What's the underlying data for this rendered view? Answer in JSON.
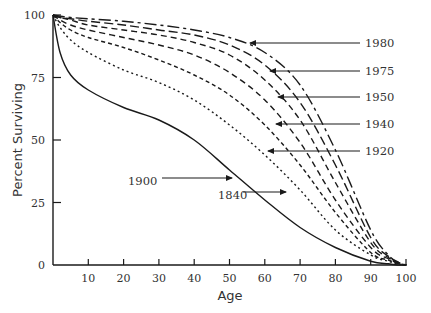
{
  "chart_data": {
    "type": "line",
    "title": "",
    "xlabel": "Age",
    "ylabel": "Percent Surviving",
    "xlim": [
      0,
      100
    ],
    "ylim": [
      0,
      100
    ],
    "grid": false,
    "x_ticks": [
      10,
      20,
      30,
      40,
      50,
      60,
      70,
      80,
      90,
      100
    ],
    "x_tick_labels": [
      "10",
      "20",
      "30",
      "40",
      "50",
      "60",
      "70",
      "80",
      "90",
      "100"
    ],
    "y_ticks": [
      0,
      25,
      50,
      75,
      100
    ],
    "y_tick_labels": [
      "0",
      "25",
      "50",
      "75",
      "100"
    ],
    "legend_position": "inline arrows",
    "x": [
      0,
      2,
      5,
      10,
      20,
      30,
      40,
      50,
      60,
      70,
      80,
      90,
      95,
      98,
      100
    ],
    "series": [
      {
        "name": "1840",
        "style": "solid",
        "values": [
          100,
          85,
          76,
          70,
          63,
          58,
          50,
          38,
          26,
          15,
          7,
          1.5,
          0.5,
          0,
          0
        ],
        "label_pos": {
          "x": 218,
          "y": 195
        },
        "arrow": {
          "x1": 243,
          "x2": 286,
          "y": 192
        }
      },
      {
        "name": "1900",
        "style": "dotted",
        "values": [
          100,
          95,
          90,
          85,
          78,
          73,
          66,
          56,
          44,
          30,
          14,
          4,
          1.5,
          0.3,
          0
        ],
        "label_pos": {
          "x": 128,
          "y": 181
        },
        "arrow": {
          "x1": 162,
          "x2": 232,
          "y": 178
        }
      },
      {
        "name": "1920",
        "style": "short-dash",
        "values": [
          100,
          97,
          94,
          91,
          87,
          82,
          76,
          68,
          56,
          40,
          21,
          5,
          2,
          0.5,
          0
        ],
        "label_pos": {
          "x": 365,
          "y": 151
        },
        "arrow": {
          "x1": 360,
          "x2": 268,
          "y": 151
        }
      },
      {
        "name": "1940",
        "style": "dash",
        "values": [
          100,
          98,
          96,
          94,
          91,
          88,
          84,
          77,
          66,
          49,
          26,
          7,
          2.5,
          0.5,
          0
        ],
        "label_pos": {
          "x": 365,
          "y": 124
        },
        "arrow": {
          "x1": 360,
          "x2": 276,
          "y": 124
        }
      },
      {
        "name": "1950",
        "style": "dash",
        "values": [
          100,
          99,
          98,
          96,
          94,
          92,
          89,
          84,
          74,
          58,
          33,
          9,
          3,
          0.7,
          0
        ],
        "label_pos": {
          "x": 365,
          "y": 97
        },
        "arrow": {
          "x1": 360,
          "x2": 278,
          "y": 97
        }
      },
      {
        "name": "1975",
        "style": "long-dash",
        "values": [
          100,
          99,
          98.5,
          97.5,
          96,
          94,
          92,
          88,
          80,
          65,
          40,
          11,
          3.5,
          0.8,
          0
        ],
        "label_pos": {
          "x": 365,
          "y": 71
        },
        "arrow": {
          "x1": 360,
          "x2": 270,
          "y": 71
        }
      },
      {
        "name": "1980",
        "style": "dash-dot",
        "values": [
          100,
          99.5,
          99,
          98.5,
          97.5,
          96,
          94,
          91,
          85,
          72,
          46,
          14,
          4,
          1,
          0
        ],
        "label_pos": {
          "x": 365,
          "y": 43
        },
        "arrow": {
          "x1": 360,
          "x2": 250,
          "y": 43
        }
      }
    ]
  },
  "colors": {
    "line": "#1a1a1a",
    "text": "#333333",
    "background": "#ffffff"
  }
}
